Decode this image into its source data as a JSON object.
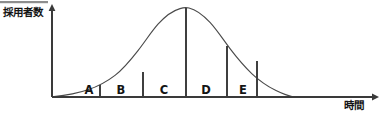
{
  "figure": {
    "width": 383,
    "height": 113,
    "background": "#ffffff",
    "ink_color": "#3a3a3a",
    "curve_color": "#4a4a4a",
    "top_rule_color": "#8e8e8e"
  },
  "axes": {
    "y_label": "採用者数",
    "x_label": "時間",
    "y_axis_x": 52,
    "baseline_y": 97,
    "x_axis_end": 375,
    "y_axis_top": 8,
    "arrow_y_path": "M 52 4 L 48.6 11 L 55.4 11 Z",
    "arrow_x_path": "M 379 97 L 372 93.6 L 372 100.4 Z"
  },
  "top_rule": {
    "x": 0,
    "y": 1,
    "width": 48,
    "height": 2.2
  },
  "chart_data": {
    "type": "area",
    "title": "",
    "xlabel": "時間",
    "ylabel": "採用者数",
    "curve_name": "normal-distribution",
    "distribution": {
      "shape": "bell",
      "peak_x": 186,
      "peak_y": 8,
      "left_foot_x": 54,
      "right_foot_x": 292,
      "baseline_y": 97
    },
    "curve_path": "M 54 96.6 C 66 95.4 78 93.2 88 89.8 C 98 86.4 107 81.6 115 75.4 C 124 68.4 131 59.6 138 50.6 C 145 41.6 151 32.2 158 24.2 C 165 16.4 173 10.6 180 8.6 C 183 7.7 186 7.4 189 8.0 C 196 9.6 203 15.0 210 22.4 C 217 30.0 223 39.4 230 48.6 C 237 57.8 244 66.2 252 73.8 C 259 80.4 267 86.0 276 90.6 C 283 94.0 288 95.8 292 96.6",
    "segments": [
      {
        "label": "A",
        "left_x": 78,
        "right_x": 100,
        "center_x": 89,
        "divider_top_y": 85.2
      },
      {
        "label": "B",
        "left_x": 100,
        "right_x": 143,
        "center_x": 121,
        "divider_top_y": 71.6
      },
      {
        "label": "C",
        "left_x": 143,
        "right_x": 186,
        "center_x": 164,
        "divider_top_y": 45.0
      },
      {
        "label": "D",
        "left_x": 186,
        "right_x": 227,
        "center_x": 206,
        "divider_top_y": 8.0
      },
      {
        "label": "E",
        "left_x": 227,
        "right_x": 262,
        "center_x": 243,
        "divider_top_y": 45.6
      }
    ],
    "dividers": [
      {
        "name": "divider-a-b",
        "x": 100,
        "top_y": 85.2,
        "bottom_y": 97
      },
      {
        "name": "divider-b-c",
        "x": 143,
        "top_y": 71.6,
        "bottom_y": 97
      },
      {
        "name": "divider-c-d",
        "x": 186,
        "top_y": 45.0,
        "bottom_y": 97
      },
      {
        "name": "divider-peak",
        "x": 186,
        "top_y": 8.0,
        "bottom_y": 97
      },
      {
        "name": "divider-d-e",
        "x": 227,
        "top_y": 45.6,
        "bottom_y": 97
      },
      {
        "name": "divider-e-end",
        "x": 257,
        "top_y": 61.2,
        "bottom_y": 97
      }
    ],
    "label_baseline_y": 94,
    "grid": false,
    "legend": null,
    "tick_labels": []
  }
}
